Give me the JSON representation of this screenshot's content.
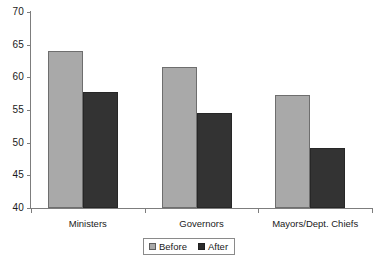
{
  "chart_data": {
    "type": "bar",
    "title": "",
    "xlabel": "",
    "ylabel": "",
    "categories": [
      "Ministers",
      "Governors",
      "Mayors/Dept. Chiefs"
    ],
    "series": [
      {
        "name": "Before",
        "values": [
          64.0,
          61.6,
          57.3
        ],
        "color": "#a9a9a9"
      },
      {
        "name": "After",
        "values": [
          57.7,
          54.5,
          49.2
        ],
        "color": "#333333"
      }
    ],
    "ylim": [
      40,
      70
    ],
    "yticks": [
      40,
      45,
      50,
      55,
      60,
      65,
      70
    ],
    "ytick_labels": [
      "40",
      "45",
      "50",
      "55",
      "60",
      "65",
      "70"
    ],
    "grid": false,
    "legend": {
      "position": "bottom-center",
      "entries": [
        {
          "label": "Before",
          "swatch": "before-swatch"
        },
        {
          "label": "After",
          "swatch": "after-swatch"
        }
      ]
    }
  }
}
